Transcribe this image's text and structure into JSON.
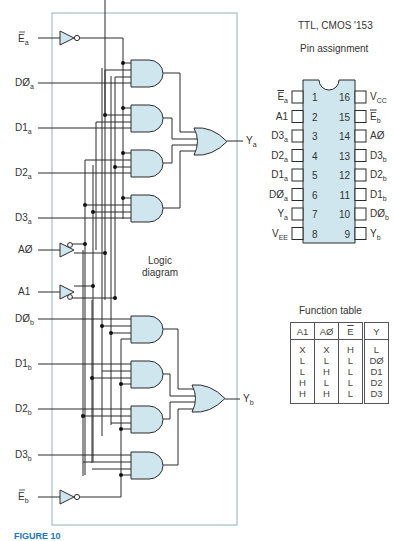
{
  "header": {
    "family": "TTL, CMOS '153",
    "pin_title": "Pin assignment",
    "logic_label_line1": "Logic",
    "logic_label_line2": "diagram",
    "function_title": "Function table"
  },
  "inputs_left": [
    {
      "base": "E",
      "sub": "a",
      "overbar": true
    },
    {
      "base": "DØ",
      "sub": "a"
    },
    {
      "base": "D1",
      "sub": "a"
    },
    {
      "base": "D2",
      "sub": "a"
    },
    {
      "base": "D3",
      "sub": "a"
    },
    {
      "base": "AØ",
      "sub": ""
    },
    {
      "base": "A1",
      "sub": ""
    },
    {
      "base": "DØ",
      "sub": "b"
    },
    {
      "base": "D1",
      "sub": "b"
    },
    {
      "base": "D2",
      "sub": "b"
    },
    {
      "base": "D3",
      "sub": "b"
    },
    {
      "base": "E",
      "sub": "b",
      "overbar": true
    }
  ],
  "outputs": [
    {
      "base": "Y",
      "sub": "a"
    },
    {
      "base": "Y",
      "sub": "b"
    }
  ],
  "pins_left": [
    {
      "num": "1",
      "base": "E",
      "sub": "a",
      "overbar": true
    },
    {
      "num": "2",
      "base": "A1",
      "sub": ""
    },
    {
      "num": "3",
      "base": "D3",
      "sub": "a"
    },
    {
      "num": "4",
      "base": "D2",
      "sub": "a"
    },
    {
      "num": "5",
      "base": "D1",
      "sub": "a"
    },
    {
      "num": "6",
      "base": "DØ",
      "sub": "a"
    },
    {
      "num": "7",
      "base": "Y",
      "sub": "a"
    },
    {
      "num": "8",
      "base": "V",
      "sub": "EE"
    }
  ],
  "pins_right": [
    {
      "num": "16",
      "base": "V",
      "sub": "CC"
    },
    {
      "num": "15",
      "base": "E",
      "sub": "b",
      "overbar": true
    },
    {
      "num": "14",
      "base": "AØ",
      "sub": ""
    },
    {
      "num": "13",
      "base": "D3",
      "sub": "b"
    },
    {
      "num": "12",
      "base": "D2",
      "sub": "b"
    },
    {
      "num": "11",
      "base": "D1",
      "sub": "b"
    },
    {
      "num": "10",
      "base": "DØ",
      "sub": "b"
    },
    {
      "num": "9",
      "base": "Y",
      "sub": "b"
    }
  ],
  "function_table": {
    "headers": [
      "A1",
      "AØ",
      "E",
      "Y"
    ],
    "rows": [
      [
        "X",
        "X",
        "H",
        "L"
      ],
      [
        "L",
        "L",
        "L",
        "DØ"
      ],
      [
        "L",
        "H",
        "L",
        "D1"
      ],
      [
        "H",
        "L",
        "L",
        "D2"
      ],
      [
        "H",
        "H",
        "L",
        "D3"
      ]
    ]
  },
  "caption": "FIGURE 10",
  "colors": {
    "gate_fill": "#cfe6ee",
    "frame": "#8fb3bf",
    "caption": "#1b75bb"
  }
}
